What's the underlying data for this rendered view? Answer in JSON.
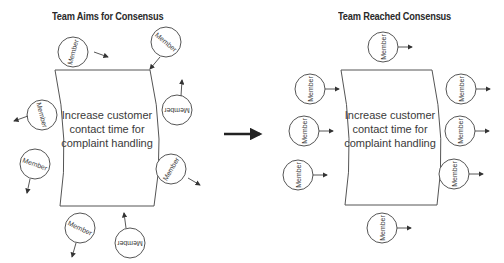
{
  "left_panel": {
    "title": "Team Aims for Consensus",
    "goal_lines": [
      "Increase customer",
      "contact time for",
      "complaint handling"
    ],
    "members": [
      {
        "label": "Member",
        "cx": 73,
        "cy": 52,
        "rot": -75,
        "ax1": 94,
        "ay1": 52,
        "ax2": 108,
        "ay2": 57
      },
      {
        "label": "Member",
        "cx": 166,
        "cy": 42,
        "rot": 40,
        "ax1": 160,
        "ay1": 57,
        "ax2": 150,
        "ay2": 69
      },
      {
        "label": "Member",
        "cx": 42,
        "cy": 115,
        "rot": 75,
        "ax1": 28,
        "ay1": 116,
        "ax2": 14,
        "ay2": 121
      },
      {
        "label": "Member",
        "cx": 177,
        "cy": 110,
        "rot": 180,
        "ax1": 181,
        "ay1": 96,
        "ax2": 182,
        "ay2": 80
      },
      {
        "label": "Member",
        "cx": 35,
        "cy": 164,
        "rot": 20,
        "ax1": 30,
        "ay1": 179,
        "ax2": 27,
        "ay2": 193
      },
      {
        "label": "Member",
        "cx": 171,
        "cy": 169,
        "rot": -60,
        "ax1": 188,
        "ay1": 178,
        "ax2": 200,
        "ay2": 185
      },
      {
        "label": "Member",
        "cx": 80,
        "cy": 228,
        "rot": 25,
        "ax1": 76,
        "ay1": 243,
        "ax2": 72,
        "ay2": 257
      },
      {
        "label": "Member",
        "cx": 130,
        "cy": 243,
        "rot": 180,
        "ax1": 126,
        "ay1": 228,
        "ax2": 124,
        "ay2": 213
      }
    ]
  },
  "arrow": {
    "x1": 224,
    "y1": 134,
    "x2": 264,
    "y2": 134
  },
  "right_panel": {
    "title": "Team Reached Consensus",
    "goal_lines": [
      "Increase customer",
      "contact time for",
      "complaint handling"
    ],
    "members": [
      {
        "label": "Member",
        "cx": 383,
        "cy": 47,
        "rot": -90,
        "ax1": 398,
        "ay1": 47,
        "ax2": 412,
        "ay2": 47
      },
      {
        "label": "Member",
        "cx": 310,
        "cy": 89,
        "rot": -90,
        "ax1": 325,
        "ay1": 89,
        "ax2": 339,
        "ay2": 89
      },
      {
        "label": "Member",
        "cx": 461,
        "cy": 89,
        "rot": -90,
        "ax1": 476,
        "ay1": 89,
        "ax2": 490,
        "ay2": 89
      },
      {
        "label": "Member",
        "cx": 304,
        "cy": 131,
        "rot": -90,
        "ax1": 319,
        "ay1": 131,
        "ax2": 333,
        "ay2": 131
      },
      {
        "label": "Member",
        "cx": 460,
        "cy": 131,
        "rot": -90,
        "ax1": 475,
        "ay1": 131,
        "ax2": 489,
        "ay2": 131
      },
      {
        "label": "Member",
        "cx": 298,
        "cy": 175,
        "rot": -90,
        "ax1": 313,
        "ay1": 175,
        "ax2": 327,
        "ay2": 175
      },
      {
        "label": "Member",
        "cx": 454,
        "cy": 174,
        "rot": -90,
        "ax1": 469,
        "ay1": 174,
        "ax2": 483,
        "ay2": 174
      },
      {
        "label": "Member",
        "cx": 382,
        "cy": 228,
        "rot": -90,
        "ax1": 397,
        "ay1": 228,
        "ax2": 411,
        "ay2": 228
      }
    ]
  },
  "colors": {
    "stroke": "#555555",
    "text": "#3a3a3a",
    "title": "#2a2a2a",
    "arrow": "#222222"
  }
}
